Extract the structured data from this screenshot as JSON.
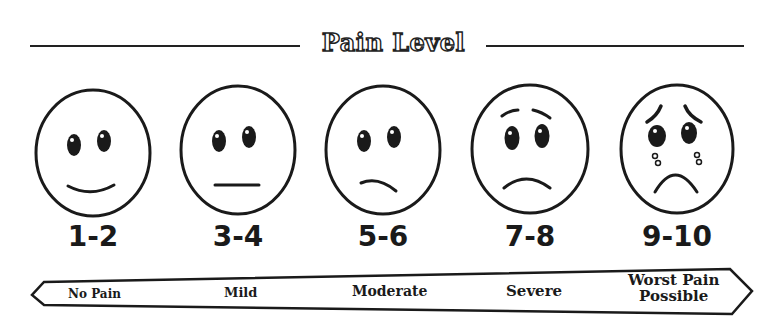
{
  "title": "Pain Level",
  "faces": [
    {
      "score": "1-2",
      "expression": "smile-face-icon"
    },
    {
      "score": "3-4",
      "expression": "neutral-face-icon"
    },
    {
      "score": "5-6",
      "expression": "slight-frown-face-icon"
    },
    {
      "score": "7-8",
      "expression": "frown-face-icon"
    },
    {
      "score": "9-10",
      "expression": "crying-face-icon"
    }
  ],
  "scale": {
    "labels": [
      "No Pain",
      "Mild",
      "Moderate",
      "Severe"
    ],
    "last_label_line1": "Worst Pain",
    "last_label_line2": "Possible"
  },
  "colors": {
    "ink": "#1a1a1a",
    "background": "#ffffff"
  }
}
